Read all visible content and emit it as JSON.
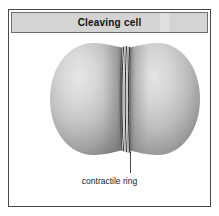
{
  "panel": {
    "title": "Cleaving cell",
    "border_color": "#4a4a4a",
    "background_color": "#ffffff"
  },
  "title_bar": {
    "label": "Cleaving cell",
    "background_color": "#d4d4d4",
    "text_color": "#111111"
  },
  "illustration": {
    "name": "cleaving-cell-diagram",
    "description": "Two rounded daughter cell lobes separated by a cleavage furrow",
    "lobe_highlight_color": "#e2e2e2",
    "lobe_midtone_color": "#b6b6b6",
    "lobe_shadow_color": "#7c7c7c",
    "ring_color": "#2b2b2b",
    "leader_line_color": "#333333"
  },
  "annotations": {
    "ring_label": "contractile ring"
  }
}
